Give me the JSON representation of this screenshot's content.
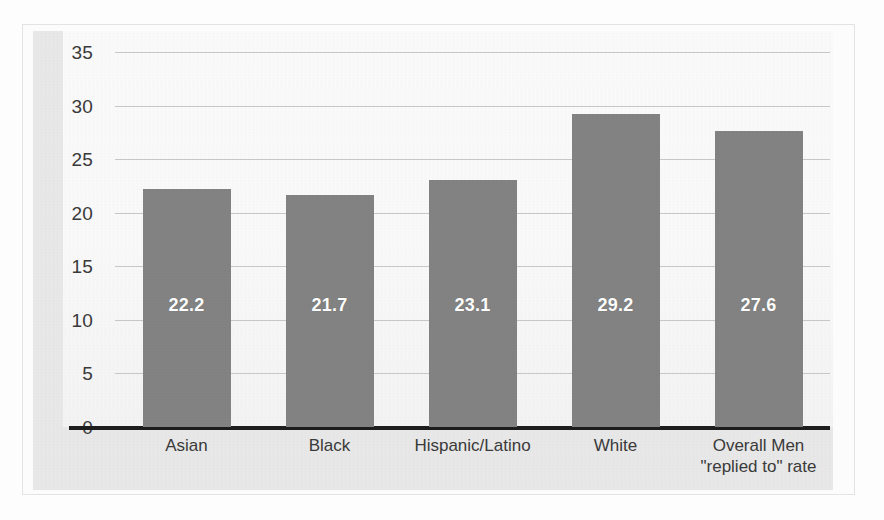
{
  "chart_data": {
    "type": "bar",
    "title": "",
    "subtitle": "",
    "xlabel": "",
    "ylabel": "",
    "categories": [
      "Asian",
      "Black",
      "Hispanic/Latino",
      "White",
      "Overall Men\n\"replied to\" rate"
    ],
    "values": [
      22.2,
      21.7,
      23.1,
      29.2,
      27.6
    ],
    "value_labels": [
      "22.2",
      "21.7",
      "23.1",
      "29.2",
      "27.6"
    ],
    "ylim": [
      0,
      35
    ],
    "ytick_values": [
      0,
      5,
      10,
      15,
      20,
      25,
      30,
      35
    ],
    "ytick_labels": [
      "0",
      "5",
      "10",
      "15",
      "20",
      "25",
      "30",
      "35"
    ],
    "grid": true,
    "grid_axis": "y",
    "legend": false,
    "legend_position": "none",
    "series": [
      {
        "name": "replied to rate",
        "values": [
          22.2,
          21.7,
          23.1,
          29.2,
          27.6
        ]
      }
    ],
    "colors": {
      "bar": "#838383",
      "bar_label_text": "#ffffff",
      "plot_background": "#fafafa",
      "figure_background": "#e9e9e9",
      "gridline": "#c9c9c9",
      "axis_line": "#1d1d1d",
      "tick_text": "#3a3a3a"
    }
  }
}
